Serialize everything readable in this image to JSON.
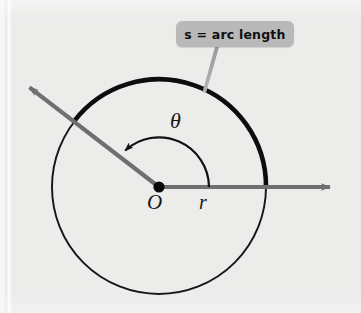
{
  "figure": {
    "background_color": "#ececeb",
    "callout": {
      "text": "s = arc length",
      "box_color": "#b9b9b9",
      "text_color": "#101010",
      "leader_color": "#9a9a9a"
    },
    "labels": {
      "center_point": "O",
      "radius": "r",
      "angle": "θ"
    },
    "colors": {
      "circle_stroke": "#151515",
      "arc_highlight": "#0d0d0d",
      "ray": "#6f6f6f",
      "angle_arc": "#111111",
      "center_dot": "#0a0a0a"
    },
    "geometry": {
      "center_x": 159,
      "center_y": 187,
      "radius": 107,
      "ray_initial_angle_deg": 0,
      "ray_terminal_angle_deg": 142.5,
      "arrow_right_tip_x": 337,
      "arrow_right_tip_y": 187,
      "arrow_upleft_tip_x": 22,
      "arrow_upleft_tip_y": 82,
      "angle_arc_radius": 50,
      "highlight_arc_start_deg": 0,
      "highlight_arc_end_deg": 142.5
    }
  }
}
